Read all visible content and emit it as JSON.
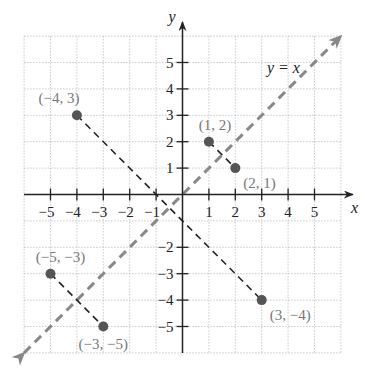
{
  "chart_data": {
    "type": "scatter",
    "title": "",
    "xlabel": "x",
    "ylabel": "y",
    "xlim": [
      -6,
      6
    ],
    "ylim": [
      -6,
      6
    ],
    "grid": true,
    "x_ticks": [
      "-5",
      "-4",
      "-3",
      "-2",
      "-1",
      "1",
      "2",
      "3",
      "4",
      "5"
    ],
    "y_ticks": [
      "5",
      "4",
      "3",
      "2",
      "1",
      "-2",
      "-3",
      "-4",
      "-5"
    ],
    "points": [
      {
        "x": -4,
        "y": 3,
        "label": "(−4, 3)"
      },
      {
        "x": 3,
        "y": -4,
        "label": "(3, −4)"
      },
      {
        "x": 1,
        "y": 2,
        "label": "(1, 2)"
      },
      {
        "x": 2,
        "y": 1,
        "label": "(2, 1)"
      },
      {
        "x": -5,
        "y": -3,
        "label": "(−5, −3)"
      },
      {
        "x": -3,
        "y": -5,
        "label": "(−3, −5)"
      }
    ],
    "segments": [
      {
        "from": [
          -4,
          3
        ],
        "to": [
          3,
          -4
        ],
        "style": "dashed"
      },
      {
        "from": [
          1,
          2
        ],
        "to": [
          2,
          1
        ],
        "style": "dashed"
      },
      {
        "from": [
          -5,
          -3
        ],
        "to": [
          -3,
          -5
        ],
        "style": "dashed"
      }
    ],
    "lines": [
      {
        "equation": "y = x",
        "from": [
          -6,
          -6
        ],
        "to": [
          6,
          6
        ],
        "style": "dashed-gray-arrows"
      }
    ],
    "annotations": [
      "y = x"
    ]
  },
  "colors": {
    "axis": "#222222",
    "grid": "#bbbbbb",
    "point": "#555555",
    "identity_line": "#888888",
    "segment": "#222222",
    "point_label": "#777777"
  }
}
